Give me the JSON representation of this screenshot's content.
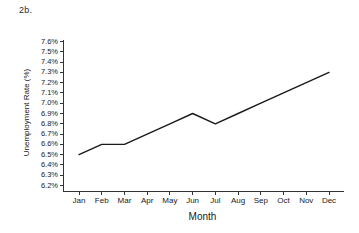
{
  "figure": {
    "label": "2b."
  },
  "chart_data": {
    "type": "line",
    "title": "2b.",
    "xlabel": "Month",
    "ylabel": "Unemployment Rate (%)",
    "categories": [
      "Jan",
      "Feb",
      "Mar",
      "Apr",
      "May",
      "Jun",
      "Jul",
      "Aug",
      "Sep",
      "Oct",
      "Nov",
      "Dec"
    ],
    "values": [
      6.5,
      6.6,
      6.6,
      6.7,
      6.8,
      6.9,
      6.8,
      6.9,
      7.0,
      7.1,
      7.2,
      7.3
    ],
    "series": [
      {
        "name": "Unemployment Rate",
        "values": [
          6.5,
          6.6,
          6.6,
          6.7,
          6.8,
          6.9,
          6.8,
          6.9,
          7.0,
          7.1,
          7.2,
          7.3
        ]
      }
    ],
    "ylim": [
      6.15,
      7.65
    ],
    "ytick_labels": [
      "7.6%",
      "7.5%",
      "7.4%",
      "7.3%",
      "7.2%",
      "7.1%",
      "7.0%",
      "6.9%",
      "6.8%",
      "6.7%",
      "6.6%",
      "6.5%",
      "6.4%",
      "6.3%",
      "6.2%"
    ],
    "ytick_values": [
      7.6,
      7.5,
      7.4,
      7.3,
      7.2,
      7.1,
      7.0,
      6.9,
      6.8,
      6.7,
      6.6,
      6.5,
      6.4,
      6.3,
      6.2
    ],
    "grid": false,
    "legend": "none",
    "line_color": "#1a1a1a",
    "axis_color": "#333333"
  }
}
